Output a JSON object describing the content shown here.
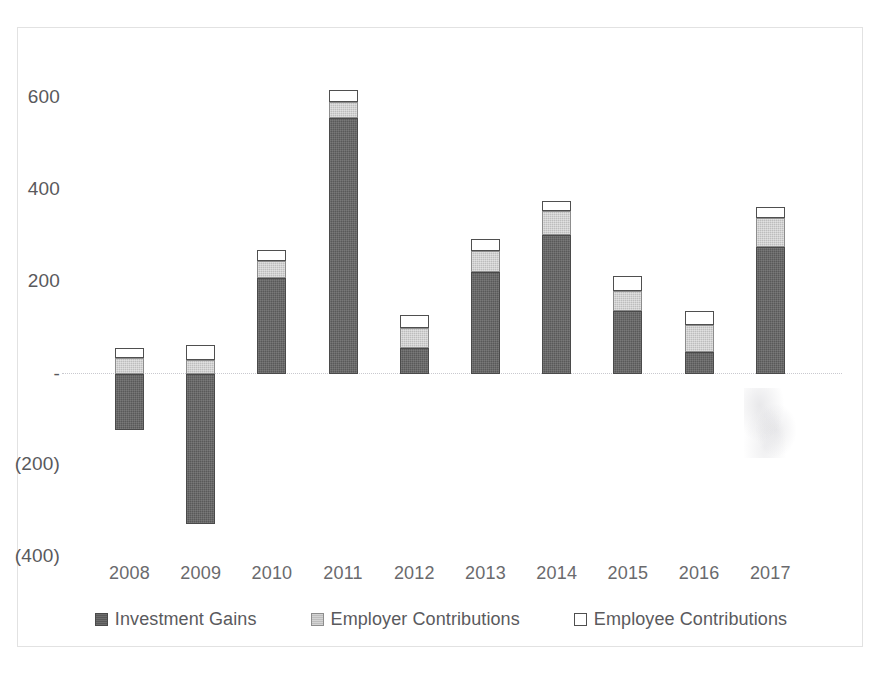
{
  "chart_data": {
    "type": "bar",
    "subtype": "stacked-bar-with-negative-values",
    "title": "",
    "xlabel": "",
    "ylabel": "",
    "categories": [
      "2008",
      "2009",
      "2010",
      "2011",
      "2012",
      "2013",
      "2014",
      "2015",
      "2016",
      "2017"
    ],
    "series": [
      {
        "name": "Investment Gains",
        "color": "#595959",
        "values": [
          -122,
          -325,
          209,
          557,
          57,
          222,
          302,
          137,
          48,
          276
        ]
      },
      {
        "name": "Employer Contributions",
        "color": "#bdbdbd",
        "values": [
          35,
          31,
          36,
          35,
          44,
          46,
          52,
          44,
          59,
          63
        ]
      },
      {
        "name": "Employee Contributions",
        "color": "#ffffff",
        "values": [
          22,
          32,
          24,
          26,
          28,
          26,
          22,
          33,
          30,
          24
        ]
      }
    ],
    "y_axis": {
      "ticks": [
        600,
        400,
        200,
        0,
        -200,
        -400
      ],
      "tick_labels": [
        "600",
        "400",
        "200",
        "-",
        "(200)",
        "(400)"
      ],
      "ylim": [
        -400,
        680
      ],
      "grid": false
    },
    "legend": {
      "position": "bottom",
      "entries": [
        {
          "label": "Investment Gains",
          "swatch": "dark"
        },
        {
          "label": "Employer Contributions",
          "swatch": "gray"
        },
        {
          "label": "Employee Contributions",
          "swatch": "white"
        }
      ]
    },
    "zero_line": {
      "style": "dotted",
      "color": "#c9c9cf"
    },
    "plot_border": {
      "color": "#e2e2e2"
    }
  }
}
